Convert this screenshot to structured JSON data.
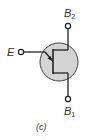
{
  "diagram": {
    "type": "ujt-symbol",
    "terminals": {
      "emitter": {
        "label": "E"
      },
      "base2": {
        "label": "B",
        "subscript": "2"
      },
      "base1": {
        "label": "B",
        "subscript": "1"
      }
    },
    "caption": "(c)",
    "colors": {
      "body_fill": "#d4d4d4",
      "line": "#222222",
      "background": "#ffffff"
    }
  }
}
